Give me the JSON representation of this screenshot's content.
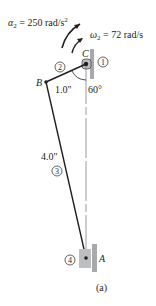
{
  "figure": {
    "caption": "(a)",
    "colors": {
      "link": "#231f20",
      "ground": "#a7a9ac",
      "slider": "#bcbec0",
      "dashed": "#808285"
    },
    "annotations": {
      "alpha": {
        "symbol": "α",
        "sub": "2",
        "eq": " = 250 rad/s",
        "sup": "2"
      },
      "omega": {
        "symbol": "ω",
        "sub": "2",
        "eq": " = 72 rad/s"
      }
    },
    "points": {
      "A": "A",
      "B": "B",
      "C": "C"
    },
    "links": {
      "link1": "1",
      "link2": "2",
      "link3": "3",
      "link4": "4"
    },
    "dimensions": {
      "bc_length": "1.0\"",
      "ab_length": "4.0\"",
      "angle": "60°"
    }
  }
}
